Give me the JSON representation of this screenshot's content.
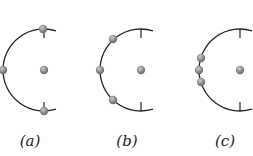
{
  "figure": {
    "stroke_color": "#222222",
    "dot_color": "#8a8a8a",
    "dot_highlight": "#c8c8c8",
    "panels": [
      {
        "id": "a",
        "label": "(a)",
        "label_x": 30,
        "center": [
          44,
          70
        ],
        "radius": 41,
        "arc_end_x": 56,
        "ticks": [
          [
            44,
            29,
            44,
            38
          ],
          [
            44,
            111,
            44,
            102
          ]
        ],
        "charges": [
          [
            43,
            29
          ],
          [
            3,
            70
          ],
          [
            44,
            111
          ]
        ],
        "center_charge": [
          44,
          70
        ]
      },
      {
        "id": "b",
        "label": "(b)",
        "label_x": 127,
        "center": [
          141,
          70
        ],
        "radius": 41,
        "arc_end_x": 153,
        "ticks": [
          [
            141,
            29,
            141,
            38
          ],
          [
            141,
            111,
            141,
            102
          ]
        ],
        "charges": [
          [
            113,
            39
          ],
          [
            100,
            70
          ],
          [
            113,
            100
          ]
        ],
        "center_charge": [
          141,
          70
        ]
      },
      {
        "id": "c",
        "label": "(c)",
        "label_x": 225,
        "center": [
          240,
          70
        ],
        "radius": 41,
        "arc_end_x": 252,
        "ticks": [
          [
            240,
            29,
            240,
            38
          ],
          [
            240,
            111,
            240,
            102
          ]
        ],
        "charges": [
          [
            201,
            58
          ],
          [
            199,
            70
          ],
          [
            201,
            82
          ]
        ],
        "center_charge": [
          240,
          70
        ]
      }
    ]
  }
}
